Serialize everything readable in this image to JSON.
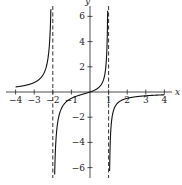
{
  "chart_data": {
    "type": "line",
    "title": "",
    "xlabel": "x",
    "ylabel": "y",
    "xlim": [
      -4,
      4
    ],
    "ylim": [
      -6.5,
      6.5
    ],
    "grid": false,
    "legend": null,
    "x_ticks": [
      -4,
      -3,
      -2,
      -1,
      1,
      2,
      3,
      4
    ],
    "x_tick_labels": [
      "-4",
      "-3",
      "-2",
      "-1",
      "1",
      "2",
      "3",
      "4"
    ],
    "y_ticks": [
      -6,
      -4,
      -2,
      2,
      4,
      6
    ],
    "y_tick_labels": [
      "-6",
      "-4",
      "-2",
      "2",
      "4",
      "6"
    ],
    "function": "y = -x / ((x - 1)(x + 2))",
    "vertical_asymptotes": [
      -2,
      1
    ],
    "horizontal_asymptote": 0,
    "series": [
      {
        "name": "left branch",
        "x": [
          -4,
          -3.5,
          -3,
          -2.5,
          -2.2,
          -2.1
        ],
        "y": [
          0.4,
          0.52,
          0.75,
          1.43,
          3.44,
          6.77
        ]
      },
      {
        "name": "middle branch",
        "x": [
          -1.9,
          -1.5,
          -1,
          -0.5,
          0,
          0.5,
          0.8,
          0.9
        ],
        "y": [
          -6.9,
          -1.2,
          -0.5,
          -0.22,
          0,
          0.4,
          1.43,
          3.1
        ]
      },
      {
        "name": "right branch",
        "x": [
          1.1,
          1.5,
          2,
          3,
          4
        ],
        "y": [
          -3.55,
          -0.86,
          -0.5,
          -0.3,
          -0.22
        ]
      }
    ],
    "annotations": [
      "dashed vertical line at x = -2",
      "dashed vertical line at x = 1"
    ]
  }
}
